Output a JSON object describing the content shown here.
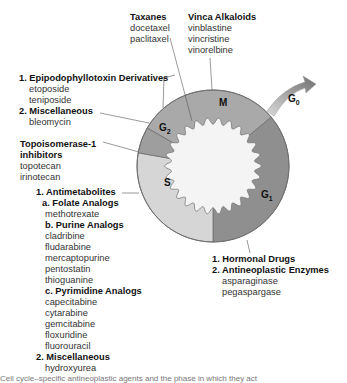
{
  "diagram": {
    "phases": {
      "m": "M",
      "g1": "G",
      "g1_sub": "1",
      "g2": "G",
      "g2_sub": "2",
      "s": "S",
      "g0": "G",
      "g0_sub": "0"
    },
    "colors": {
      "m": "#a9a9a9",
      "g1": "#8f8f8f",
      "g2": "#9e9e9e",
      "s": "#d6d6d6",
      "inner": "#f4f4f4",
      "outline": "#6e6e6e"
    },
    "taxanes": {
      "title": "Taxanes",
      "drugs": [
        "docetaxel",
        "paclitaxel"
      ]
    },
    "vinca": {
      "title": "Vinca Alkaloids",
      "drugs": [
        "vinblastine",
        "vincristine",
        "vinorelbine"
      ]
    },
    "g2_group": {
      "title1": "1. Epipodophyllotoxin Derivatives",
      "drugs1": [
        "etoposide",
        "teniposide"
      ],
      "title2": "2. Miscellaneous",
      "drugs2": [
        "bleomycin"
      ]
    },
    "topo": {
      "title_line1": "Topoisomerase-1",
      "title_line2": "inhibitors",
      "drugs": [
        "topotecan",
        "irinotecan"
      ]
    },
    "s_group": {
      "title1": "1. Antimetabolites",
      "sub_a": "a. Folate Analogs",
      "drugs_a": [
        "methotrexate"
      ],
      "sub_b": "b. Purine Analogs",
      "drugs_b": [
        "cladribine",
        "fludarabine",
        "mercaptopurine",
        "pentostatin",
        "thioguanine"
      ],
      "sub_c": "c. Pyrimidine Analogs",
      "drugs_c": [
        "capecitabine",
        "cytarabine",
        "gemcitabine",
        "floxuridine",
        "fluorouracil"
      ],
      "title2": "2. Miscellaneous",
      "drugs2": [
        "hydroxyurea"
      ]
    },
    "g1_group": {
      "title1": "1. Hormonal Drugs",
      "title2": "2. Antineoplastic Enzymes",
      "drugs2": [
        "asparaginase",
        "pegaspargase"
      ]
    },
    "caption": "Cell cycle–specific antineoplastic agents and the phase in which they act"
  }
}
